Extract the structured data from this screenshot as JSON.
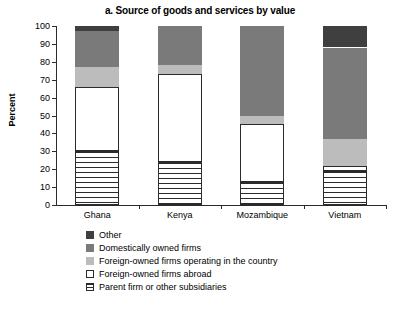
{
  "chart_data": {
    "type": "bar",
    "subtype": "stacked-column-100",
    "title": "a. Source of goods and services by value",
    "xlabel": "",
    "ylabel": "Percent",
    "ylim": [
      0,
      100
    ],
    "yticks": [
      0,
      10,
      20,
      30,
      40,
      50,
      60,
      70,
      80,
      90,
      100
    ],
    "grid": false,
    "legend_position": "below",
    "categories": [
      "Ghana",
      "Kenya",
      "Mozambique",
      "Vietnam"
    ],
    "series": [
      {
        "name": "Parent firm or other subsidiaries",
        "color": "#ffffff",
        "pattern": "horizontal-lines",
        "values": [
          30,
          24,
          13,
          19
        ]
      },
      {
        "name": "Foreign-owned firms abroad",
        "color": "#ffffff",
        "pattern": "solid-outline",
        "values": [
          36,
          49,
          32,
          3
        ]
      },
      {
        "name": "Foreign-owned firms operating in the country",
        "color": "#bcbcbc",
        "pattern": "solid",
        "values": [
          11,
          5,
          5,
          15
        ]
      },
      {
        "name": "Domestically owned firms",
        "color": "#7a7a7a",
        "pattern": "solid",
        "values": [
          20,
          22,
          50,
          51
        ]
      },
      {
        "name": "Other",
        "color": "#3f3f3f",
        "pattern": "solid",
        "values": [
          3,
          0,
          0,
          12
        ]
      }
    ],
    "cumulative_tops": {
      "Ghana": [
        30,
        66,
        77,
        97,
        100
      ],
      "Kenya": [
        24,
        73,
        78,
        100,
        100
      ],
      "Mozambique": [
        13,
        45,
        50,
        100,
        100
      ],
      "Vietnam": [
        19,
        22,
        37,
        88,
        100
      ]
    }
  },
  "legend": {
    "items": [
      {
        "label": "Other",
        "swatch": "other"
      },
      {
        "label": "Domestically owned firms",
        "swatch": "domestic"
      },
      {
        "label": "Foreign-owned firms operating in the country",
        "swatch": "foreign-local"
      },
      {
        "label": "Foreign-owned firms abroad",
        "swatch": "foreign-abroad"
      },
      {
        "label": "Parent firm or other subsidiaries",
        "swatch": "parent"
      }
    ]
  }
}
